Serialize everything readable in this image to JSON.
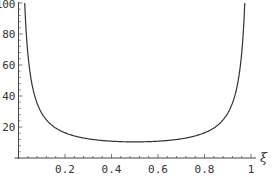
{
  "chart_data": {
    "type": "line",
    "title": "",
    "xlabel": "ξ",
    "ylabel": "",
    "xlim": [
      0,
      1.02
    ],
    "ylim": [
      0,
      100
    ],
    "grid": false,
    "legend": null,
    "x_ticks": [
      "0.2",
      "0.4",
      "0.6",
      "0.8",
      "1"
    ],
    "x_tick_values": [
      0.2,
      0.4,
      0.6,
      0.8,
      1.0
    ],
    "y_ticks": [
      "20",
      "40",
      "60",
      "80",
      "100"
    ],
    "y_tick_values": [
      20,
      40,
      60,
      80,
      100
    ],
    "series": [
      {
        "name": "curve",
        "color": "#333333",
        "x": [
          0.027,
          0.03,
          0.04,
          0.05,
          0.07,
          0.1,
          0.15,
          0.2,
          0.3,
          0.4,
          0.5,
          0.6,
          0.7,
          0.8,
          0.85,
          0.9,
          0.93,
          0.95,
          0.96,
          0.97,
          0.973
        ],
        "y": [
          99,
          89,
          68,
          55,
          40,
          29,
          20,
          16.3,
          12.4,
          10.8,
          10.4,
          10.8,
          12.4,
          16.3,
          20,
          29,
          40,
          55,
          68,
          89,
          99
        ]
      }
    ]
  }
}
